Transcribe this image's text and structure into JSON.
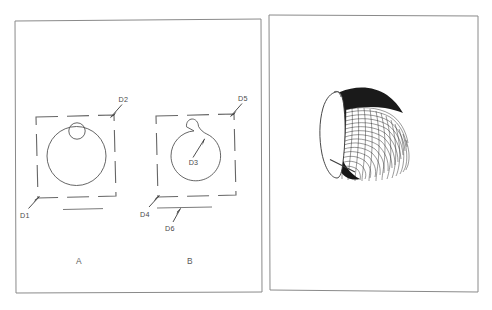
{
  "figure": {
    "background_color": "#ffffff",
    "line_color": "#555555",
    "frame_color": "#8a8a8a"
  },
  "left_panel": {
    "name": "cross-section-panel",
    "captions": [
      {
        "id": "caption-a",
        "label": "A"
      },
      {
        "id": "caption-b",
        "label": "B"
      }
    ],
    "callouts": [
      {
        "id": "d1",
        "label": "D1"
      },
      {
        "id": "d2",
        "label": "D2"
      },
      {
        "id": "d3",
        "label": "D3"
      },
      {
        "id": "d4",
        "label": "D4"
      },
      {
        "id": "d5",
        "label": "D5"
      },
      {
        "id": "d6",
        "label": "D6"
      }
    ],
    "diagram_a": {
      "name": "diagram-a",
      "description": "Circle with small circle tangent at top inside dashed square boundary"
    },
    "diagram_b": {
      "name": "diagram-b",
      "description": "Circle with smooth bump protrusion at top inside dashed square boundary"
    }
  },
  "right_panel": {
    "name": "three-d-render-panel",
    "object": {
      "name": "meshed-elbow-surface",
      "description": "Three dimensional curved elbow tube rendered as a fine quadrilateral mesh with a white elliptical end face"
    }
  }
}
